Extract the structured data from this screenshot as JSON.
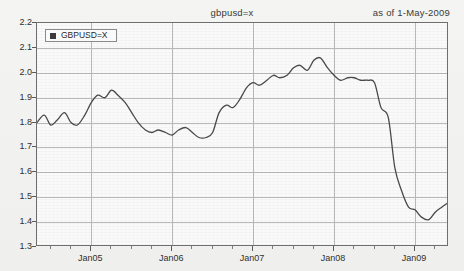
{
  "header": {
    "title": "gbpusd=x",
    "as_of": "as of  1-May-2009"
  },
  "legend": {
    "entries": [
      {
        "label": "GBPUSD=X",
        "color": "#3b3b3b",
        "marker": "square-marker-icon"
      }
    ],
    "position": "top-left"
  },
  "colors": {
    "line": "#4a4a4a",
    "grid": "#b9b9b9",
    "frame": "#6e6e6e",
    "plot_background": "#fafafa",
    "page_background": "#f1f1ef",
    "text": "#2f2f2f"
  },
  "chart_data": {
    "type": "line",
    "title": "gbpusd=x",
    "subtitle": "as of  1-May-2009",
    "xlabel": "",
    "ylabel": "",
    "grid": true,
    "legend_position": "top-left",
    "ylim": [
      1.3,
      2.2
    ],
    "ytick_labels": [
      "2.2",
      "2.1",
      "2.0",
      "1.9",
      "1.8",
      "1.7",
      "1.6",
      "1.5",
      "1.4",
      "1.3"
    ],
    "ytick_values": [
      2.2,
      2.1,
      2.0,
      1.9,
      1.8,
      1.7,
      1.6,
      1.5,
      1.4,
      1.3
    ],
    "xtick_labels": [
      "Jan05",
      "Jan06",
      "Jan07",
      "Jan08",
      "Jan09"
    ],
    "xtick_values": [
      2005.0,
      2006.0,
      2007.0,
      2008.0,
      2009.0
    ],
    "xlim": [
      2004.33,
      2009.42
    ],
    "x_minor_tick_interval_years": 0.25,
    "series": [
      {
        "name": "GBPUSD=X",
        "color": "#4a4a4a",
        "x": [
          2004.33,
          2004.42,
          2004.5,
          2004.58,
          2004.67,
          2004.75,
          2004.83,
          2004.92,
          2005.0,
          2005.08,
          2005.17,
          2005.25,
          2005.33,
          2005.42,
          2005.5,
          2005.58,
          2005.67,
          2005.75,
          2005.83,
          2005.92,
          2006.0,
          2006.08,
          2006.17,
          2006.25,
          2006.33,
          2006.42,
          2006.5,
          2006.58,
          2006.67,
          2006.75,
          2006.83,
          2006.92,
          2007.0,
          2007.08,
          2007.17,
          2007.25,
          2007.33,
          2007.42,
          2007.5,
          2007.58,
          2007.67,
          2007.75,
          2007.83,
          2007.92,
          2008.0,
          2008.08,
          2008.17,
          2008.25,
          2008.33,
          2008.42,
          2008.5,
          2008.58,
          2008.67,
          2008.75,
          2008.83,
          2008.92,
          2009.0,
          2009.08,
          2009.17,
          2009.25,
          2009.33,
          2009.42
        ],
        "y": [
          1.8,
          1.83,
          1.79,
          1.81,
          1.84,
          1.8,
          1.79,
          1.83,
          1.88,
          1.91,
          1.9,
          1.93,
          1.91,
          1.88,
          1.84,
          1.8,
          1.77,
          1.76,
          1.77,
          1.76,
          1.75,
          1.77,
          1.78,
          1.76,
          1.74,
          1.74,
          1.76,
          1.84,
          1.87,
          1.86,
          1.89,
          1.94,
          1.96,
          1.95,
          1.97,
          1.99,
          1.98,
          1.99,
          2.02,
          2.03,
          2.01,
          2.05,
          2.06,
          2.02,
          1.99,
          1.97,
          1.98,
          1.98,
          1.97,
          1.97,
          1.96,
          1.86,
          1.82,
          1.62,
          1.53,
          1.46,
          1.45,
          1.42,
          1.41,
          1.44,
          1.46,
          1.48
        ]
      }
    ],
    "annotations": []
  }
}
